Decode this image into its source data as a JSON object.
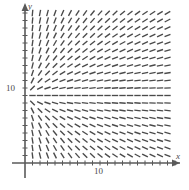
{
  "figure": {
    "kind": "slope-field",
    "background_color": "#ffffff",
    "ink_color": "#4a4a4a",
    "axis_color": "#5a5a5a"
  },
  "axes": {
    "x_axis_label": "x",
    "y_axis_label": "y",
    "x_tick_labels": [
      {
        "value": 10,
        "text": "10"
      }
    ],
    "y_tick_labels": [
      {
        "value": 10,
        "text": "10"
      }
    ],
    "origin_px": {
      "x": 25,
      "y": 163
    },
    "px_per_unit": 7.5,
    "x_range": [
      0,
      21.5
    ],
    "y_range": [
      0,
      21.5
    ],
    "x_tick_step": 1,
    "y_tick_step": 1,
    "arrowheads": [
      "x-positive",
      "y-positive"
    ]
  },
  "chart_data": {
    "type": "scatter",
    "title": "",
    "xlabel": "x",
    "ylabel": "y",
    "xlim": [
      0,
      21.5
    ],
    "ylim": [
      0,
      21.5
    ],
    "grid": false,
    "legend": "none",
    "slope_model": "dy/dx = (y - 9) / x",
    "sample_step": {
      "x": 1,
      "y": 1
    },
    "sample_x_start": 1,
    "sample_y_start": 1,
    "segment_half_length_px": 3.2,
    "annotations": []
  }
}
